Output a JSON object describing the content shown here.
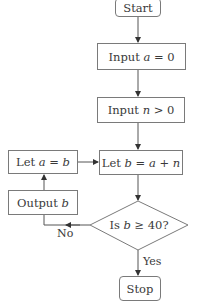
{
  "flowchart": {
    "nodes": {
      "start": {
        "label": "Start",
        "shape": "terminal"
      },
      "input_a": {
        "prefix": "Input ",
        "var": "a",
        "suffix": " = 0",
        "shape": "process"
      },
      "input_n": {
        "prefix": "Input ",
        "var": "n",
        "suffix": " > 0",
        "shape": "process"
      },
      "let_b": {
        "prefix": "Let ",
        "var": "b",
        "mid": " = ",
        "var2": "a",
        "mid2": " + ",
        "var3": "n",
        "shape": "process"
      },
      "let_a": {
        "prefix": "Let ",
        "var": "a",
        "mid": " = ",
        "var2": "b",
        "shape": "process"
      },
      "output_b": {
        "prefix": "Output ",
        "var": "b",
        "shape": "process"
      },
      "decision": {
        "prefix": "Is ",
        "var": "b",
        "suffix": " ≥ 40?",
        "shape": "decision"
      },
      "stop": {
        "label": "Stop",
        "shape": "terminal"
      }
    },
    "edge_labels": {
      "no": "No",
      "yes": "Yes"
    },
    "edges": [
      [
        "start",
        "input_a"
      ],
      [
        "input_a",
        "input_n"
      ],
      [
        "input_n",
        "let_b"
      ],
      [
        "let_b",
        "decision"
      ],
      [
        "decision",
        "stop",
        "Yes"
      ],
      [
        "decision",
        "output_b",
        "No"
      ],
      [
        "output_b",
        "let_a"
      ],
      [
        "let_a",
        "let_b"
      ]
    ],
    "colors": {
      "stroke": "#7a7a7a",
      "text": "#3a3a3a",
      "background": "#ffffff"
    }
  }
}
